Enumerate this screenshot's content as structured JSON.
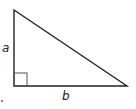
{
  "diagram": {
    "type": "right-triangle",
    "vertices": {
      "top": [
        14,
        10
      ],
      "right_angle": [
        14,
        86
      ],
      "right": [
        127,
        86
      ]
    },
    "right_angle_marker_size": 13,
    "labels": {
      "vertical_leg": "a",
      "horizontal_leg": "b"
    },
    "stroke_color": "#222222",
    "marker_color": "#555555",
    "dot_position": [
      2,
      101
    ]
  }
}
